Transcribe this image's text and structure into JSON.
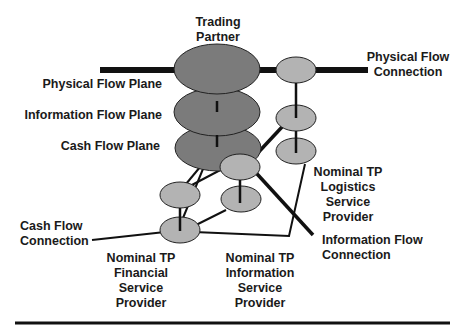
{
  "diagram": {
    "title": "Trading Partner",
    "planes": [
      {
        "label": "Physical Flow Plane"
      },
      {
        "label": "Information Flow Plane"
      },
      {
        "label": "Cash Flow Plane"
      }
    ],
    "connections": [
      {
        "label_line1": "Physical Flow",
        "label_line2": "Connection"
      },
      {
        "label_line1": "Information Flow",
        "label_line2": "Connection"
      },
      {
        "label_line1": "Cash Flow",
        "label_line2": "Connection"
      }
    ],
    "providers": [
      {
        "lines": [
          "Nominal TP",
          "Logistics",
          "Service",
          "Provider"
        ]
      },
      {
        "lines": [
          "Nominal TP",
          "Financial",
          "Service",
          "Provider"
        ]
      },
      {
        "lines": [
          "Nominal TP",
          "Information",
          "Service",
          "Provider"
        ]
      }
    ],
    "title_lines": [
      "Trading",
      "Partner"
    ],
    "colors": {
      "trading_partner_fill": "#7b7b7b",
      "provider_fill": "#b3b3b3",
      "stroke": "#111111",
      "background": "#ffffff"
    }
  }
}
